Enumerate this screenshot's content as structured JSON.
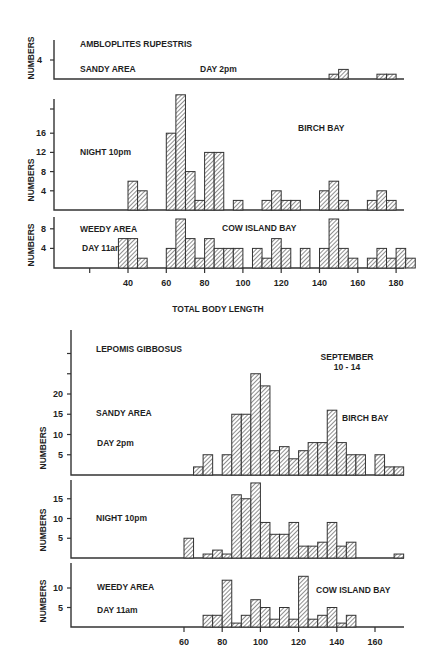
{
  "chart_data": [
    {
      "type": "bar",
      "title": "AMBLOPLITES RUPESTRIS",
      "xlabel": "TOTAL BODY LENGTH",
      "ylabel": "NUMBERS",
      "xticks": [
        40,
        60,
        80,
        100,
        120,
        140,
        160,
        180
      ],
      "bin_width": 5,
      "panels": [
        {
          "name": "SANDY AREA — DAY 2pm",
          "labels": [
            "SANDY AREA",
            "DAY 2pm"
          ],
          "yticks": [
            4
          ],
          "bins": [
            [
              145,
              2
            ],
            [
              150,
              4
            ],
            [
              170,
              2
            ],
            [
              175,
              2
            ]
          ]
        },
        {
          "name": "NIGHT 10pm — BIRCH BAY",
          "labels": [
            "NIGHT 10pm",
            "BIRCH BAY"
          ],
          "yticks": [
            4,
            8,
            12,
            16
          ],
          "bins": [
            [
              40,
              6
            ],
            [
              45,
              4
            ],
            [
              60,
              16
            ],
            [
              65,
              24
            ],
            [
              70,
              8
            ],
            [
              75,
              2
            ],
            [
              80,
              12
            ],
            [
              85,
              12
            ],
            [
              95,
              2
            ],
            [
              110,
              2
            ],
            [
              115,
              4
            ],
            [
              120,
              2
            ],
            [
              125,
              2
            ],
            [
              140,
              4
            ],
            [
              145,
              6
            ],
            [
              150,
              2
            ],
            [
              165,
              2
            ],
            [
              170,
              4
            ],
            [
              175,
              2
            ]
          ]
        },
        {
          "name": "WEEDY AREA — DAY 11am — COW ISLAND BAY",
          "labels": [
            "WEEDY AREA",
            "DAY 11am",
            "COW ISLAND BAY"
          ],
          "yticks": [
            4,
            8
          ],
          "bins": [
            [
              35,
              6
            ],
            [
              40,
              6
            ],
            [
              45,
              2
            ],
            [
              60,
              4
            ],
            [
              65,
              10
            ],
            [
              70,
              6
            ],
            [
              75,
              2
            ],
            [
              80,
              6
            ],
            [
              85,
              4
            ],
            [
              90,
              4
            ],
            [
              95,
              4
            ],
            [
              105,
              4
            ],
            [
              110,
              2
            ],
            [
              115,
              6
            ],
            [
              120,
              4
            ],
            [
              130,
              4
            ],
            [
              140,
              4
            ],
            [
              145,
              10
            ],
            [
              150,
              4
            ],
            [
              155,
              2
            ],
            [
              165,
              2
            ],
            [
              170,
              4
            ],
            [
              175,
              2
            ],
            [
              180,
              4
            ],
            [
              185,
              2
            ]
          ]
        }
      ]
    },
    {
      "type": "bar",
      "title": "LEPOMIS GIBBOSUS",
      "subtitle": "SEPTEMBER 10-14",
      "xlabel": "",
      "ylabel": "NUMBERS",
      "xticks": [
        60,
        80,
        100,
        120,
        140,
        160
      ],
      "bin_width": 5,
      "panels": [
        {
          "name": "SANDY AREA — DAY 2pm — BIRCH BAY",
          "labels": [
            "SANDY AREA",
            "DAY 2pm",
            "BIRCH BAY"
          ],
          "yticks": [
            5,
            10,
            15,
            20
          ],
          "bins": [
            [
              65,
              2
            ],
            [
              70,
              5
            ],
            [
              80,
              5
            ],
            [
              85,
              15
            ],
            [
              90,
              15
            ],
            [
              95,
              25
            ],
            [
              100,
              22
            ],
            [
              105,
              6
            ],
            [
              110,
              7
            ],
            [
              115,
              4
            ],
            [
              120,
              6
            ],
            [
              125,
              8
            ],
            [
              130,
              8
            ],
            [
              135,
              16
            ],
            [
              140,
              8
            ],
            [
              145,
              5
            ],
            [
              150,
              5
            ],
            [
              160,
              5
            ],
            [
              165,
              2
            ],
            [
              170,
              2
            ]
          ]
        },
        {
          "name": "NIGHT 10pm",
          "labels": [
            "NIGHT 10pm"
          ],
          "yticks": [
            5,
            10,
            15
          ],
          "bins": [
            [
              60,
              5
            ],
            [
              70,
              1
            ],
            [
              75,
              2
            ],
            [
              80,
              1
            ],
            [
              85,
              16
            ],
            [
              90,
              15
            ],
            [
              95,
              19
            ],
            [
              100,
              9
            ],
            [
              105,
              6
            ],
            [
              110,
              6
            ],
            [
              115,
              9
            ],
            [
              120,
              3
            ],
            [
              125,
              3
            ],
            [
              130,
              4
            ],
            [
              135,
              9
            ],
            [
              140,
              3
            ],
            [
              145,
              4
            ],
            [
              170,
              1
            ]
          ]
        },
        {
          "name": "WEEDY AREA — DAY 11am — COW ISLAND BAY",
          "labels": [
            "WEEDY AREA",
            "DAY 11am",
            "COW ISLAND BAY"
          ],
          "yticks": [
            5,
            10
          ],
          "bins": [
            [
              70,
              3
            ],
            [
              75,
              3
            ],
            [
              80,
              12
            ],
            [
              85,
              1
            ],
            [
              90,
              3
            ],
            [
              95,
              7
            ],
            [
              100,
              5
            ],
            [
              105,
              2
            ],
            [
              110,
              5
            ],
            [
              115,
              2
            ],
            [
              120,
              13
            ],
            [
              125,
              2
            ],
            [
              130,
              3
            ],
            [
              135,
              5
            ],
            [
              140,
              1
            ],
            [
              145,
              3
            ]
          ]
        }
      ]
    }
  ],
  "labels": {
    "top_title": "AMBLOPLITES RUPESTRIS",
    "top_p1_a": "SANDY AREA",
    "top_p1_b": "DAY 2pm",
    "top_p2_a": "NIGHT 10pm",
    "top_p2_b": "BIRCH BAY",
    "top_p3_a": "WEEDY AREA",
    "top_p3_b": "DAY 11am",
    "top_p3_c": "COW ISLAND BAY",
    "top_xlabel": "TOTAL BODY LENGTH",
    "ylabel": "NUMBERS",
    "bot_title": "LEPOMIS GIBBOSUS",
    "bot_sub1": "SEPTEMBER",
    "bot_sub2": "10 - 14",
    "bot_p1_a": "SANDY AREA",
    "bot_p1_b": "DAY 2pm",
    "bot_p1_c": "BIRCH BAY",
    "bot_p2_a": "NIGHT 10pm",
    "bot_p3_a": "WEEDY AREA",
    "bot_p3_b": "DAY 11am",
    "bot_p3_c": "COW ISLAND BAY"
  }
}
